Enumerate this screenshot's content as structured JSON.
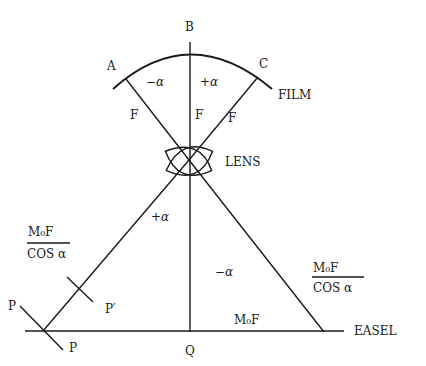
{
  "diagram": {
    "type": "optical-geometry",
    "points": {
      "A": "A",
      "B": "B",
      "C": "C",
      "P_left_top": "P",
      "P_left_bottom": "P",
      "P_prime": "P′",
      "Q": "Q"
    },
    "labels": {
      "film": "FILM",
      "lens": "LENS",
      "easel": "EASEL",
      "focal_left": "F",
      "focal_center": "F",
      "focal_right": "F",
      "angle_top_left": "−α",
      "angle_top_right": "+α",
      "angle_bottom_left": "+α",
      "angle_bottom_right": "−α",
      "bottom_distance": "M₀F"
    },
    "fractions": {
      "left": {
        "numerator": "M₀F",
        "denominator": "COS α"
      },
      "right": {
        "numerator": "M₀F",
        "denominator": "COS α"
      }
    }
  }
}
